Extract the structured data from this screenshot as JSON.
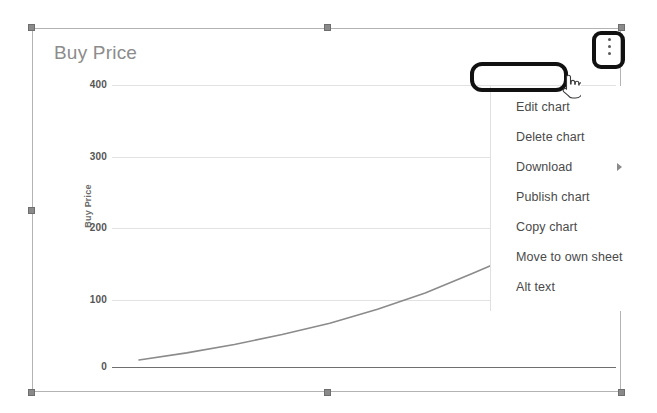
{
  "chart": {
    "title": "Buy Price",
    "y_axis_title": "Buy Price",
    "selected": "true"
  },
  "chart_data": {
    "type": "line",
    "title": "Buy Price",
    "xlabel": "",
    "ylabel": "Buy Price",
    "ylim": [
      0,
      400
    ],
    "yticks": [
      0,
      100,
      200,
      300,
      400
    ],
    "ytick_labels": [
      "0",
      "100",
      "200",
      "300",
      "400"
    ],
    "grid": true,
    "legend": "none",
    "series": [
      {
        "name": "Buy Price",
        "color": "#8b8b8b",
        "x": [
          0,
          1,
          2,
          3,
          4,
          5,
          6,
          7,
          8,
          9,
          10
        ],
        "values": [
          10,
          20,
          32,
          46,
          62,
          82,
          105,
          133,
          162,
          196,
          232
        ]
      }
    ]
  },
  "ticks": {
    "t400": "400",
    "t300": "300",
    "t200": "200",
    "t100": "100",
    "t0": "0"
  },
  "menu": {
    "items": [
      {
        "label": "Edit chart",
        "has_submenu": false
      },
      {
        "label": "Delete chart",
        "has_submenu": false
      },
      {
        "label": "Download",
        "has_submenu": true
      },
      {
        "label": "Publish chart",
        "has_submenu": false
      },
      {
        "label": "Copy chart",
        "has_submenu": false
      },
      {
        "label": "Move to own sheet",
        "has_submenu": false
      },
      {
        "label": "Alt text",
        "has_submenu": false
      }
    ]
  },
  "annotations": {
    "highlight_edit_chart": "Edit chart",
    "highlight_kebab": "more-options",
    "color": "#111111"
  },
  "colors": {
    "title_gray": "#8c8c8c",
    "line_gray": "#8b8b8b",
    "grid_gray": "#e2e2e2",
    "axis_gray": "#6f6f6f",
    "handle_gray": "#8a8a8a",
    "menu_text": "#4a4a4a"
  }
}
